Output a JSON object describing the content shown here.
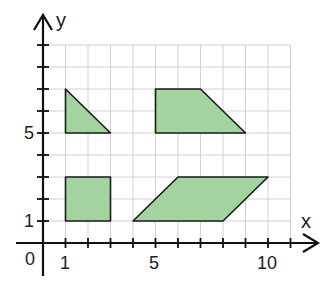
{
  "axes": {
    "x_label": "x",
    "y_label": "y",
    "origin_label": "0",
    "x_tick_labels": [
      {
        "value": 1,
        "label": "1"
      },
      {
        "value": 5,
        "label": "5"
      },
      {
        "value": 10,
        "label": "10"
      }
    ],
    "y_tick_labels": [
      {
        "value": 1,
        "label": "1"
      },
      {
        "value": 5,
        "label": "5"
      }
    ],
    "x_range": [
      0,
      11
    ],
    "y_range": [
      0,
      9
    ]
  },
  "colors": {
    "shape_fill": "#a3d4a0",
    "shape_stroke": "#1a1a1a",
    "grid": "#d0d0d0",
    "axis": "#111111"
  },
  "shapes": [
    {
      "name": "triangle",
      "points": [
        [
          1,
          7
        ],
        [
          1,
          5
        ],
        [
          3,
          5
        ]
      ]
    },
    {
      "name": "trapezoid",
      "points": [
        [
          5,
          7
        ],
        [
          7,
          7
        ],
        [
          9,
          5
        ],
        [
          5,
          5
        ]
      ]
    },
    {
      "name": "square",
      "points": [
        [
          1,
          3
        ],
        [
          3,
          3
        ],
        [
          3,
          1
        ],
        [
          1,
          1
        ]
      ]
    },
    {
      "name": "parallelogram",
      "points": [
        [
          4,
          1
        ],
        [
          6,
          3
        ],
        [
          10,
          3
        ],
        [
          8,
          1
        ]
      ]
    }
  ]
}
